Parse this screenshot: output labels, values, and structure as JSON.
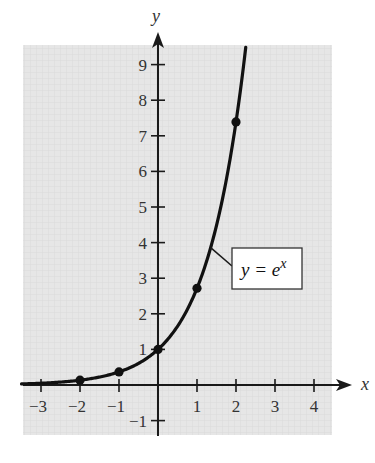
{
  "chart_data": {
    "type": "line",
    "title": "",
    "function": "exp",
    "xlabel": "x",
    "ylabel": "y",
    "xlim": [
      -3.5,
      4.4
    ],
    "ylim": [
      -1.4,
      9.5
    ],
    "x_ticks": [
      -3,
      -2,
      -1,
      1,
      2,
      3,
      4
    ],
    "x_tick_labels": [
      "−3",
      "−2",
      "−1",
      "1",
      "2",
      "3",
      "4"
    ],
    "y_ticks": [
      -1,
      1,
      2,
      3,
      4,
      5,
      6,
      7,
      8,
      9
    ],
    "y_tick_labels": [
      "−1",
      "1",
      "2",
      "3",
      "4",
      "5",
      "6",
      "7",
      "8",
      "9"
    ],
    "grid": false,
    "series": [
      {
        "name": "y = e^x",
        "curve_x_range": [
          -3.5,
          2.25
        ],
        "points": [
          {
            "x": -2,
            "y": 0.135
          },
          {
            "x": -1,
            "y": 0.368
          },
          {
            "x": 0,
            "y": 1
          },
          {
            "x": 1,
            "y": 2.718
          },
          {
            "x": 2,
            "y": 7.389
          }
        ]
      }
    ],
    "annotation": {
      "label_main": "y = e",
      "label_sup": "x",
      "anchor_x": 1.35
    }
  },
  "colors": {
    "background_panel": "#e6e6e6",
    "curve": "#111111",
    "axis": "#1a1a1a",
    "label_box": "#ffffff"
  }
}
